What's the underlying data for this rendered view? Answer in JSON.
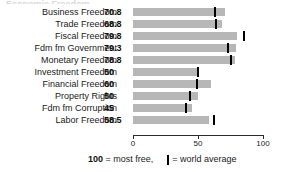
{
  "chart_data": {
    "type": "bar",
    "orientation": "horizontal",
    "title": "",
    "xlabel": "",
    "ylabel": "",
    "xlim": [
      0,
      100
    ],
    "xticks": [
      0,
      50,
      100
    ],
    "xtick_labels": [
      "0",
      "50",
      "100"
    ],
    "grid": false,
    "legend_position": "bottom",
    "categories": [
      "Business Freedom",
      "Trade Freedom",
      "Fiscal Freedom",
      "Fdm fm Government",
      "Monetary Freedom",
      "Investment Freedom",
      "Financial Freedom",
      "Property Rights",
      "Fdm fm Corruption",
      "Labor Freedom"
    ],
    "series": [
      {
        "name": "Score",
        "values": [
          70.8,
          68.8,
          79.8,
          79.3,
          78.8,
          50,
          60,
          50,
          45,
          58.5
        ]
      },
      {
        "name": "world average",
        "values": [
          63,
          64,
          85,
          73,
          75,
          50,
          49,
          44,
          41,
          62
        ]
      }
    ],
    "value_labels": [
      "70.8",
      "68.8",
      "79.8",
      "79.3",
      "78.8",
      "50",
      "60",
      "50",
      "45",
      "58.5"
    ],
    "colors": {
      "bar": "#b7b7b7",
      "world_average_marker": "#000000",
      "axis": "#2b2b2b",
      "text": "#1a1a1a",
      "background": "#ffffff"
    }
  },
  "title_remnant": "Economic Freedom",
  "legend": {
    "most_free_value": "100",
    "most_free_text": "= most free,",
    "world_average_text": "= world average",
    "marker_icon": "world-average-tick-icon"
  }
}
